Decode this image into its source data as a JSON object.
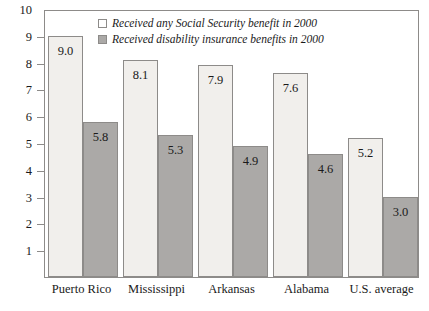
{
  "chart_data": {
    "type": "bar",
    "title": "",
    "subtitle": "",
    "xlabel": "",
    "ylabel": "",
    "ylim": [
      0,
      10
    ],
    "yticks": [
      10,
      9,
      8,
      7,
      6,
      5,
      4,
      3,
      2,
      1
    ],
    "grid": false,
    "legend_position": "top-center",
    "categories": [
      "Puerto Rico",
      "Mississippi",
      "Arkansas",
      "Alabama",
      "U.S. average"
    ],
    "series": [
      {
        "name": "Received any Social Security benefit in 2000",
        "color": "#f1efec",
        "values": [
          9.0,
          8.1,
          7.9,
          7.6,
          5.2
        ],
        "labels": [
          "9.0",
          "8.1",
          "7.9",
          "7.6",
          "5.2"
        ]
      },
      {
        "name": "Received disability insurance benefits in 2000",
        "color": "#aba9a7",
        "values": [
          5.8,
          5.3,
          4.9,
          4.6,
          3.0
        ],
        "labels": [
          "5.8",
          "5.3",
          "4.9",
          "4.6",
          "3.0"
        ]
      }
    ]
  },
  "legend": {
    "items": [
      {
        "label": "Received any Social Security benefit in 2000",
        "swatch": "light"
      },
      {
        "label": "Received disability insurance benefits in 2000",
        "swatch": "dark"
      }
    ]
  },
  "axis": {
    "y_tick_labels": [
      "10",
      "9",
      "8",
      "7",
      "6",
      "5",
      "4",
      "3",
      "2",
      "1"
    ]
  }
}
